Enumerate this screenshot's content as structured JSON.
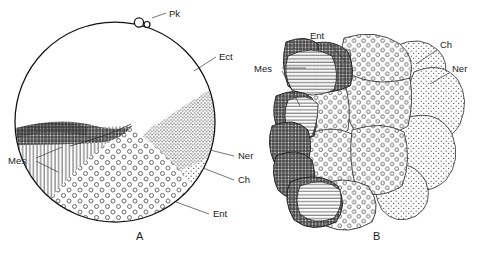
{
  "figure": {
    "background_color": "#ffffff",
    "ink_color": "#111111",
    "panels": [
      {
        "caption": "A",
        "caption_x": 136,
        "caption_y": 240,
        "description": "Sagittal view of spherical embryo showing presumptive organ-forming regions",
        "shape": "circle",
        "center_x": 115,
        "center_y": 122,
        "radius": 101,
        "labels": [
          {
            "id": "pk",
            "text": "Pk",
            "x": 169,
            "y": 16,
            "leader": "M 166 13 L 152 15"
          },
          {
            "id": "ect",
            "text": "Ect",
            "x": 219,
            "y": 60,
            "leader": "M 216 57 L 196 70"
          },
          {
            "id": "ner",
            "text": "Ner",
            "x": 238,
            "y": 159,
            "leader": "M 235 156 L 212 150"
          },
          {
            "id": "ch",
            "text": "Ch",
            "x": 238,
            "y": 183,
            "leader": "M 235 180 L 205 170"
          },
          {
            "id": "ent",
            "text": "Ent",
            "x": 213,
            "y": 217,
            "leader": "M 210 214 L 180 203"
          },
          {
            "id": "mes",
            "text": "Mes",
            "x": 11,
            "y": 163,
            "leader_a": "M 35 158 L 60 148",
            "leader_b": "M 35 161 L 57 168"
          }
        ]
      },
      {
        "caption": "B",
        "caption_x": 373,
        "caption_y": 240,
        "description": "Cluster of blastomeres in surface view showing the same presumptive regions",
        "labels": [
          {
            "id": "ent",
            "text": "Ent",
            "x": 316,
            "y": 38,
            "leader": "M 326 42 L 344 60"
          },
          {
            "id": "ch",
            "text": "Ch",
            "x": 440,
            "y": 48,
            "leader": "M 438 50 L 418 62"
          },
          {
            "id": "ner",
            "text": "Ner",
            "x": 452,
            "y": 71,
            "leader": "M 450 73 L 432 82"
          },
          {
            "id": "mes",
            "text": "Mes",
            "x": 256,
            "y": 71,
            "leader_a": "M 281 68 L 305 68",
            "leader_b": "M 281 71 L 300 104"
          }
        ]
      }
    ],
    "legend_keys": [
      {
        "abbr": "Pk",
        "meaning": "polar bodies",
        "pattern": "small open circles at animal pole"
      },
      {
        "abbr": "Ect",
        "meaning": "ectoderm",
        "pattern": "blank / unshaded"
      },
      {
        "abbr": "Ner",
        "meaning": "neural plate",
        "pattern": "dense fine stipple"
      },
      {
        "abbr": "Ch",
        "meaning": "chorda / notochord",
        "pattern": "light fine stipple"
      },
      {
        "abbr": "Ent",
        "meaning": "entoderm",
        "pattern": "open ring dots"
      },
      {
        "abbr": "Mes",
        "meaning": "mesoderm",
        "pattern": "dark cross-hatch and vertical hatch"
      }
    ]
  }
}
